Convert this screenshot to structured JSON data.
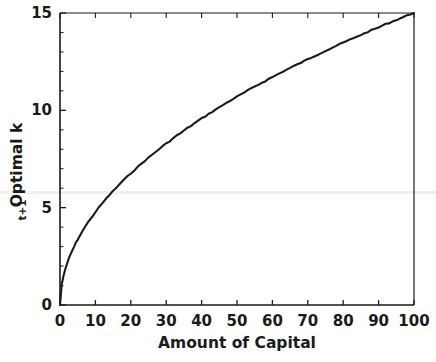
{
  "chart_data": {
    "type": "line",
    "title": "",
    "xlabel": "Amount of Capital",
    "ylabel": "Optimal k",
    "ylabel_subscript": "t+1",
    "xlim": [
      0,
      100
    ],
    "ylim": [
      0,
      15
    ],
    "xticks": [
      0,
      10,
      20,
      30,
      40,
      50,
      60,
      70,
      80,
      90,
      100
    ],
    "xtick_labels": [
      "0",
      "10",
      "20",
      "30",
      "40",
      "50",
      "60",
      "70",
      "80",
      "90",
      "100"
    ],
    "yticks": [
      0,
      5,
      10,
      15
    ],
    "ytick_labels": [
      "0",
      "5",
      "10",
      "15"
    ],
    "grid": false,
    "legend": "none",
    "line_color": "#1a1a1a",
    "line_width": 2.0,
    "series": [
      {
        "name": "Optimal policy",
        "x": [
          0,
          0.5,
          1,
          1.5,
          2,
          2.5,
          3,
          3.5,
          4,
          4.5,
          5,
          6,
          7,
          8,
          9,
          10,
          11,
          12,
          13,
          14,
          15,
          16,
          17,
          18,
          19,
          20,
          21,
          22,
          23,
          24,
          25,
          26,
          27,
          28,
          29,
          30,
          31,
          32,
          33,
          34,
          35,
          36,
          37,
          38,
          39,
          40,
          41,
          42,
          43,
          44,
          45,
          46,
          47,
          48,
          49,
          50,
          51,
          52,
          53,
          54,
          55,
          56,
          57,
          58,
          59,
          60,
          61,
          62,
          63,
          64,
          65,
          66,
          67,
          68,
          69,
          70,
          71,
          72,
          73,
          74,
          75,
          76,
          77,
          78,
          79,
          80,
          81,
          82,
          83,
          84,
          85,
          86,
          87,
          88,
          89,
          90,
          91,
          92,
          93,
          94,
          95,
          96,
          97,
          98,
          99,
          100
        ],
        "y": [
          0.0,
          0.72,
          1.02,
          1.25,
          1.44,
          1.61,
          1.76,
          1.9,
          2.03,
          2.16,
          2.28,
          2.5,
          2.7,
          2.89,
          3.06,
          3.23,
          3.39,
          3.54,
          3.69,
          3.83,
          3.96,
          4.09,
          4.22,
          4.34,
          4.46,
          4.58,
          4.69,
          4.8,
          4.91,
          5.02,
          5.12,
          5.22,
          5.32,
          5.42,
          5.52,
          5.61,
          5.7,
          5.8,
          5.89,
          5.97,
          6.06,
          6.15,
          6.23,
          6.32,
          6.4,
          6.48,
          6.56,
          6.64,
          6.72,
          6.8,
          6.87,
          6.95,
          7.02,
          7.1,
          7.17,
          7.24,
          7.31,
          7.38,
          7.45,
          7.52,
          7.59,
          7.66,
          7.73,
          7.79,
          7.86,
          7.92,
          7.99,
          8.05,
          8.12,
          8.18,
          8.24,
          8.3,
          8.36,
          8.42,
          8.48,
          8.54,
          8.6,
          8.66,
          8.72,
          8.78,
          8.84,
          8.89,
          8.95,
          9.01,
          9.06,
          9.12,
          9.17,
          9.23,
          9.28,
          9.34,
          9.39,
          9.44,
          9.5,
          9.55,
          9.6,
          9.65,
          9.71,
          9.76,
          9.81,
          9.86,
          9.91,
          9.96,
          10.01,
          10.06,
          10.11,
          10.15
        ]
      }
    ],
    "note": "Concave increasing policy function resembling y = 1.4*sqrt(x) scaled to reach 14 at x=100; rendered values below are in axis units 0-15."
  }
}
